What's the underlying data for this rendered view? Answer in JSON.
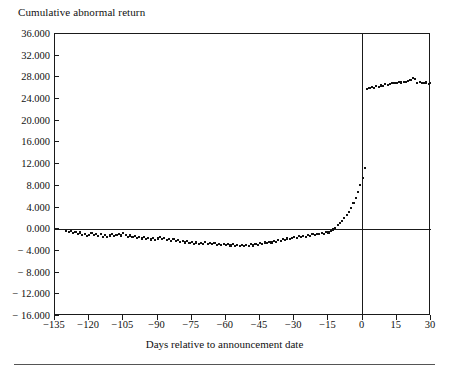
{
  "figure": {
    "title": "Cumulative abnormal return",
    "xaxis_title": "Days relative to announcement date"
  },
  "chart_data": {
    "type": "scatter",
    "title": "Cumulative abnormal return",
    "xlabel": "Days relative to announcement date",
    "ylabel": "Cumulative abnormal return",
    "xlim": [
      -135,
      30
    ],
    "ylim": [
      -16.0,
      36.0
    ],
    "grid": false,
    "legend": null,
    "marker": "filled-square",
    "marker_color": "#111111",
    "annotations": [
      {
        "type": "vertical-line",
        "x": 0,
        "label": "announcement date"
      },
      {
        "type": "horizontal-line",
        "y": 0,
        "label": "zero return"
      }
    ],
    "xticks": [
      -135,
      -120,
      -105,
      -90,
      -75,
      -60,
      -45,
      -30,
      -15,
      0,
      15,
      30
    ],
    "xtick_labels": [
      "−135",
      "−120",
      "−105",
      "−90",
      "−75",
      "−60",
      "−45",
      "−30",
      "−15",
      "0",
      "15",
      "30"
    ],
    "yticks": [
      -16.0,
      -12.0,
      -8.0,
      -4.0,
      0.0,
      4.0,
      8.0,
      12.0,
      16.0,
      20.0,
      24.0,
      28.0,
      32.0,
      36.0
    ],
    "ytick_labels": [
      "− 16.000",
      "− 12.000",
      "− 8.000",
      "− 4.000",
      "0.000",
      "4.000",
      "8.000",
      "12.000",
      "16.000",
      "20.000",
      "24.000",
      "28.000",
      "32.000",
      "36.000"
    ],
    "x": [
      -130,
      -129,
      -128,
      -127,
      -126,
      -125,
      -124,
      -123,
      -122,
      -121,
      -120,
      -119,
      -118,
      -117,
      -116,
      -115,
      -114,
      -113,
      -112,
      -111,
      -110,
      -109,
      -108,
      -107,
      -106,
      -105,
      -104,
      -103,
      -102,
      -101,
      -100,
      -99,
      -98,
      -97,
      -96,
      -95,
      -94,
      -93,
      -92,
      -91,
      -90,
      -89,
      -88,
      -87,
      -86,
      -85,
      -84,
      -83,
      -82,
      -81,
      -80,
      -79,
      -78,
      -77,
      -76,
      -75,
      -74,
      -73,
      -72,
      -71,
      -70,
      -69,
      -68,
      -67,
      -66,
      -65,
      -64,
      -63,
      -62,
      -61,
      -60,
      -59,
      -58,
      -57,
      -56,
      -55,
      -54,
      -53,
      -52,
      -51,
      -50,
      -49,
      -48,
      -47,
      -46,
      -45,
      -44,
      -43,
      -42,
      -41,
      -40,
      -39,
      -38,
      -37,
      -36,
      -35,
      -34,
      -33,
      -32,
      -31,
      -30,
      -29,
      -28,
      -27,
      -26,
      -25,
      -24,
      -23,
      -22,
      -21,
      -20,
      -19,
      -18,
      -17,
      -16,
      -15,
      -14,
      -13,
      -12,
      -11,
      -10,
      -9,
      -8,
      -7,
      -6,
      -5,
      -4,
      -3,
      -2,
      -1,
      0,
      1,
      2,
      3,
      4,
      5,
      6,
      7,
      8,
      9,
      10,
      11,
      12,
      13,
      14,
      15,
      16,
      17,
      18,
      19,
      20,
      21,
      22,
      23,
      24,
      25,
      26,
      27,
      28,
      29,
      30
    ],
    "y": [
      -0.3,
      -0.55,
      -0.35,
      -0.75,
      -0.45,
      -0.85,
      -0.6,
      -1.05,
      -0.8,
      -1.25,
      -1.0,
      -0.7,
      -1.1,
      -0.8,
      -1.25,
      -0.95,
      -1.35,
      -1.05,
      -1.45,
      -1.15,
      -0.95,
      -1.3,
      -1.05,
      -0.8,
      -1.15,
      -0.7,
      -1.05,
      -1.35,
      -1.15,
      -1.5,
      -1.25,
      -1.55,
      -1.35,
      -1.7,
      -1.45,
      -1.8,
      -1.55,
      -1.9,
      -1.6,
      -1.95,
      -1.7,
      -1.5,
      -1.85,
      -1.6,
      -1.95,
      -1.75,
      -2.1,
      -1.85,
      -2.2,
      -1.95,
      -2.3,
      -2.1,
      -2.45,
      -2.25,
      -2.6,
      -2.35,
      -2.7,
      -2.45,
      -2.8,
      -2.55,
      -2.65,
      -2.4,
      -2.7,
      -2.5,
      -2.8,
      -2.6,
      -2.85,
      -2.65,
      -2.9,
      -2.7,
      -2.95,
      -2.75,
      -3.0,
      -2.8,
      -3.05,
      -2.85,
      -3.1,
      -2.9,
      -3.15,
      -2.95,
      -3.05,
      -2.8,
      -3.0,
      -2.7,
      -2.9,
      -2.6,
      -2.75,
      -2.45,
      -2.6,
      -2.3,
      -2.45,
      -2.15,
      -2.3,
      -2.0,
      -2.15,
      -1.85,
      -2.0,
      -1.7,
      -1.85,
      -1.55,
      -1.35,
      -1.6,
      -1.3,
      -1.5,
      -1.2,
      -1.4,
      -1.1,
      -1.25,
      -0.95,
      -1.1,
      -0.85,
      -0.95,
      -0.7,
      -0.8,
      -0.55,
      -0.6,
      -0.3,
      -0.05,
      0.3,
      0.7,
      1.1,
      1.55,
      2.05,
      2.6,
      3.25,
      3.95,
      4.8,
      5.7,
      6.8,
      8.1,
      9.5,
      11.3,
      25.8,
      26.0,
      26.3,
      26.1,
      26.4,
      26.2,
      26.5,
      26.45,
      26.7,
      26.6,
      26.85,
      26.9,
      27.0,
      26.95,
      27.1,
      27.05,
      27.2,
      27.15,
      27.35,
      27.6,
      27.9,
      27.7,
      26.95,
      27.2,
      27.0,
      26.9,
      27.05,
      26.85,
      27.0,
      26.9,
      26.95
    ]
  }
}
